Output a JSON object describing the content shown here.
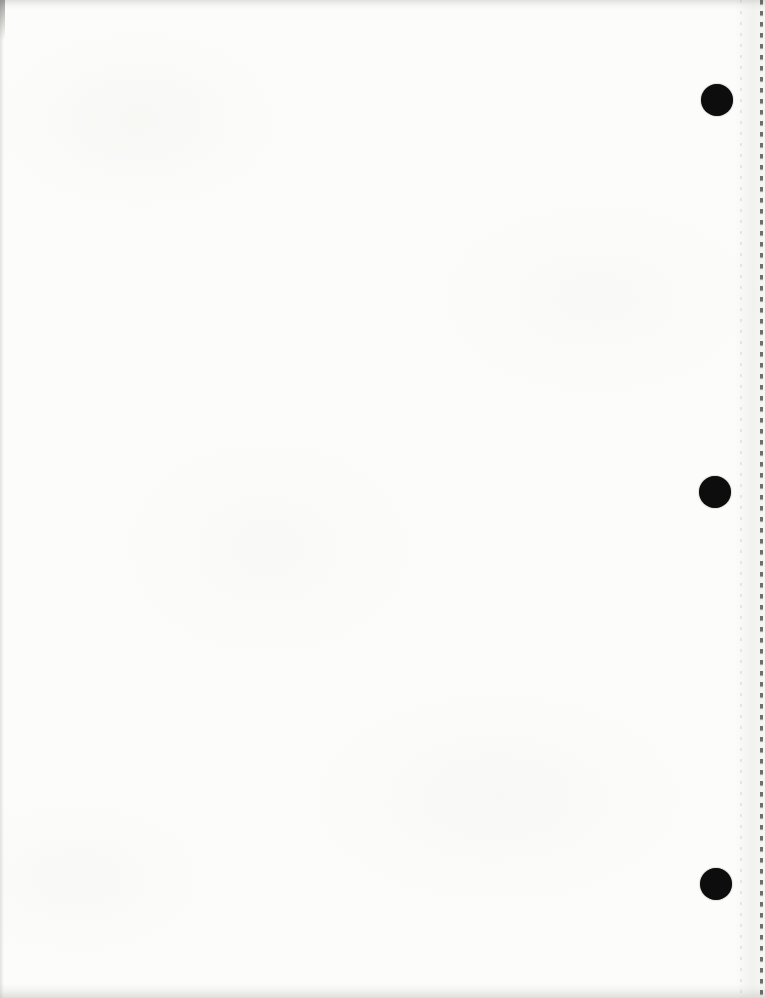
{
  "page": {
    "kind": "blank-scanned-notebook-page",
    "background_color": "#fcfcfa",
    "edge_shade_color": "#c8c8c4",
    "holes": {
      "color": "#0d0d0d",
      "diameter": 32,
      "centers": [
        {
          "x": 717,
          "y": 100
        },
        {
          "x": 715,
          "y": 492
        },
        {
          "x": 716,
          "y": 884
        }
      ]
    },
    "perforation": {
      "side": "right",
      "dash_color": "#4c4c4a",
      "dash_x": 760,
      "dash_length": 4,
      "dash_spacing": 11,
      "faint_dot_color": "#a6a6a2",
      "faint_x": 740
    }
  }
}
